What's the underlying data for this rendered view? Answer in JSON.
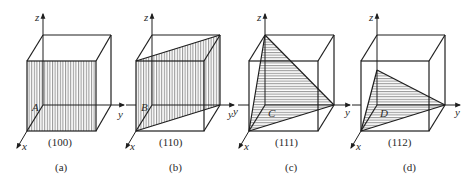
{
  "figure": {
    "panels": [
      {
        "id": "a",
        "caption": "(a)",
        "plane_label": "(100)",
        "point_label": "A",
        "axes": {
          "x": "x",
          "y": "y",
          "z": "z"
        },
        "hatch": "vertical",
        "plane_description": "front face x=1"
      },
      {
        "id": "b",
        "caption": "(b)",
        "plane_label": "(110)",
        "point_label": "B",
        "axes": {
          "x": "x",
          "y": "y",
          "y_neg": "y",
          "z": "z"
        },
        "hatch": "vertical",
        "plane_description": "diagonal plane through front-left and back-right vertical edges"
      },
      {
        "id": "c",
        "caption": "(c)",
        "plane_label": "(111)",
        "point_label": "C",
        "axes": {
          "x": "x",
          "y": "y",
          "y_neg": "y",
          "z": "z"
        },
        "hatch": "horizontal",
        "plane_description": "triangle intercepting x=1, y=1, z=1"
      },
      {
        "id": "d",
        "caption": "(d)",
        "plane_label": "(112)",
        "point_label": "D",
        "axes": {
          "x": "x",
          "y": "y",
          "y_neg": "y",
          "z": "z"
        },
        "hatch": "horizontal",
        "plane_description": "triangle intercepting x=1, y=1, z=1/2"
      }
    ],
    "colors": {
      "line": "#1e1e1e",
      "hatch": "#555555",
      "background": "#ffffff"
    }
  }
}
